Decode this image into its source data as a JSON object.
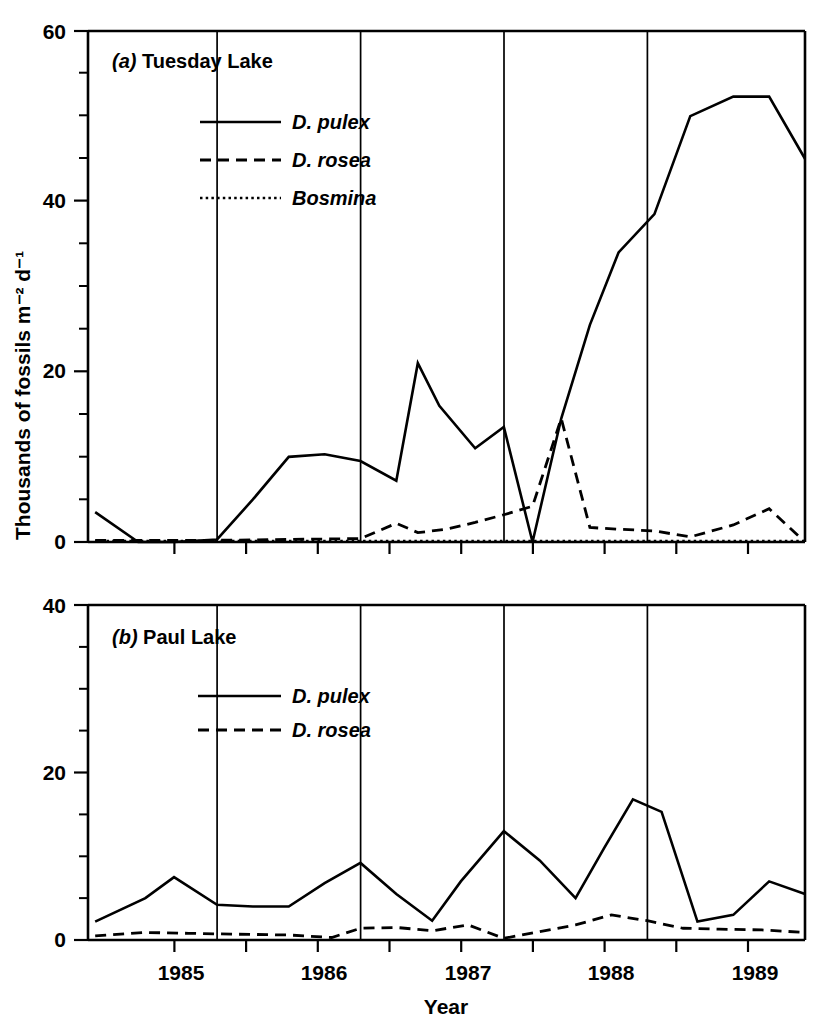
{
  "figure": {
    "ylabel": "Thousands of fossils m⁻² d⁻¹",
    "xlabel": "Year"
  },
  "panel_a": {
    "label_prefix": "(a)",
    "label_text": " Tuesday Lake",
    "yticks": [
      "0",
      "20",
      "40",
      "60"
    ],
    "legend": [
      {
        "name": "D. pulex",
        "style": "solid"
      },
      {
        "name": "D. rosea",
        "style": "dashed"
      },
      {
        "name": "Bosmina",
        "style": "dotdash"
      }
    ]
  },
  "panel_b": {
    "label_prefix": "(b)",
    "label_text": " Paul Lake",
    "yticks": [
      "0",
      "20",
      "40"
    ],
    "legend": [
      {
        "name": "D. pulex",
        "style": "solid"
      },
      {
        "name": "D. rosea",
        "style": "dashed"
      }
    ]
  },
  "xticklabels": [
    "1985",
    "1986",
    "1987",
    "1988",
    "1989"
  ],
  "chart_data": [
    {
      "type": "line",
      "title": "(a) Tuesday Lake",
      "xlabel": "Year",
      "ylabel": "Thousands of fossils m-2 d-1",
      "xlim": [
        1984.6,
        1989.6
      ],
      "ylim": [
        0,
        60
      ],
      "yticks": [
        0,
        20,
        40,
        60
      ],
      "yminor_step": 5,
      "xticks": [
        1984.6,
        1985.0,
        1985.5,
        1986.0,
        1986.5,
        1987.0,
        1987.5,
        1988.0,
        1988.5,
        1989.0,
        1989.6
      ],
      "xticklabels": [
        "1985",
        "1986",
        "1987",
        "1988",
        "1989"
      ],
      "grid": false,
      "vertical_dividers": [
        1985.5,
        1986.5,
        1987.5,
        1988.5
      ],
      "legend_position": "upper-left-inside",
      "series": [
        {
          "name": "D. pulex",
          "style": "solid",
          "x": [
            1984.65,
            1984.95,
            1985.2,
            1985.5,
            1985.75,
            1986.0,
            1986.25,
            1986.5,
            1986.75,
            1986.9,
            1987.05,
            1987.3,
            1987.5,
            1987.7,
            1987.9,
            1988.1,
            1988.3,
            1988.55,
            1988.8,
            1989.1,
            1989.35,
            1989.6
          ],
          "y": [
            3.5,
            0.0,
            0.0,
            0.3,
            5.0,
            10.0,
            10.3,
            9.5,
            7.2,
            21.0,
            16.0,
            11.0,
            13.5,
            0.0,
            14.5,
            25.5,
            34.0,
            38.5,
            50.0,
            52.3,
            52.3,
            45.0
          ]
        },
        {
          "name": "D. rosea",
          "style": "dashed",
          "x": [
            1984.65,
            1985.0,
            1985.5,
            1986.0,
            1986.5,
            1986.75,
            1986.9,
            1987.1,
            1987.3,
            1987.5,
            1987.7,
            1987.9,
            1988.1,
            1988.3,
            1988.55,
            1988.8,
            1989.1,
            1989.35,
            1989.6
          ],
          "y": [
            0.2,
            0.2,
            0.2,
            0.3,
            0.4,
            2.2,
            1.1,
            1.5,
            2.3,
            3.2,
            4.2,
            14.5,
            1.7,
            1.5,
            1.3,
            0.6,
            2.0,
            3.9,
            0.0
          ]
        },
        {
          "name": "Bosmina",
          "style": "dotdash",
          "x": [
            1984.65,
            1985.5,
            1986.5,
            1987.5,
            1988.5,
            1989.6
          ],
          "y": [
            0.1,
            0.1,
            0.1,
            0.1,
            0.1,
            0.1
          ]
        }
      ]
    },
    {
      "type": "line",
      "title": "(b) Paul Lake",
      "xlabel": "Year",
      "ylabel": "Thousands of fossils m-2 d-1",
      "xlim": [
        1984.6,
        1989.6
      ],
      "ylim": [
        0,
        40
      ],
      "yticks": [
        0,
        20,
        40
      ],
      "yminor_step": 5,
      "xticks": [
        1984.6,
        1985.0,
        1985.5,
        1986.0,
        1986.5,
        1987.0,
        1987.5,
        1988.0,
        1988.5,
        1989.0,
        1989.6
      ],
      "xticklabels": [
        "1985",
        "1986",
        "1987",
        "1988",
        "1989"
      ],
      "grid": false,
      "vertical_dividers": [
        1985.5,
        1986.5,
        1987.5,
        1988.5
      ],
      "legend_position": "upper-left-inside",
      "series": [
        {
          "name": "D. pulex",
          "style": "solid",
          "x": [
            1984.65,
            1985.0,
            1985.2,
            1985.5,
            1985.75,
            1986.0,
            1986.25,
            1986.5,
            1986.75,
            1987.0,
            1987.2,
            1987.5,
            1987.75,
            1988.0,
            1988.2,
            1988.4,
            1988.6,
            1988.85,
            1989.1,
            1989.35,
            1989.6
          ],
          "y": [
            2.2,
            5.0,
            7.5,
            4.2,
            4.0,
            4.0,
            6.8,
            9.2,
            5.5,
            2.3,
            7.0,
            13.0,
            9.5,
            5.0,
            11.0,
            16.8,
            15.3,
            2.2,
            3.0,
            7.0,
            5.5
          ]
        },
        {
          "name": "D. rosea",
          "style": "dashed",
          "x": [
            1984.65,
            1985.0,
            1985.3,
            1985.6,
            1986.0,
            1986.3,
            1986.5,
            1986.75,
            1987.0,
            1987.25,
            1987.5,
            1987.75,
            1988.0,
            1988.25,
            1988.5,
            1988.75,
            1989.0,
            1989.3,
            1989.6
          ],
          "y": [
            0.5,
            0.9,
            0.8,
            0.7,
            0.6,
            0.3,
            1.4,
            1.5,
            1.1,
            1.8,
            0.2,
            1.0,
            1.8,
            3.0,
            2.3,
            1.4,
            1.3,
            1.2,
            0.9
          ]
        }
      ]
    }
  ]
}
